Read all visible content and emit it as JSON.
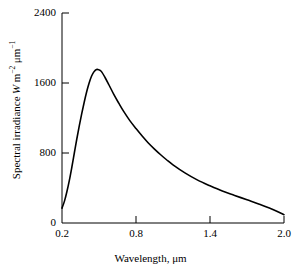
{
  "chart_data": {
    "type": "line",
    "title": "",
    "xlabel": "Wavelength, μm",
    "ylabel": "Spectral irradiance W m⁻² μm⁻¹",
    "ylabel_parts": {
      "text": "Spectral irradiance",
      "unit_symbol": "W",
      "unit_m": "m",
      "unit_m_exp": "−2",
      "unit_um": "μm",
      "unit_um_exp": "−1"
    },
    "xlim": [
      0.2,
      2.0
    ],
    "ylim": [
      0,
      2400
    ],
    "xticks": [
      0.2,
      0.8,
      1.4,
      2.0
    ],
    "xtick_labels": [
      "0.2",
      "0.8",
      "1.4",
      "2.0"
    ],
    "yticks": [
      0,
      800,
      1600,
      2400
    ],
    "ytick_labels": [
      "0",
      "800",
      "1600",
      "2400"
    ],
    "grid": false,
    "legend": false,
    "line_color": "#000000",
    "line_width": 1.6,
    "axis_color": "#000000",
    "background": "#ffffff",
    "series": [
      {
        "name": "Solar spectral irradiance",
        "x": [
          0.2,
          0.22,
          0.24,
          0.26,
          0.28,
          0.3,
          0.32,
          0.34,
          0.36,
          0.38,
          0.4,
          0.42,
          0.44,
          0.46,
          0.48,
          0.5,
          0.52,
          0.55,
          0.58,
          0.62,
          0.66,
          0.7,
          0.75,
          0.8,
          0.85,
          0.9,
          0.95,
          1.0,
          1.05,
          1.1,
          1.2,
          1.3,
          1.4,
          1.5,
          1.6,
          1.7,
          1.8,
          1.9,
          2.0
        ],
        "y": [
          170,
          250,
          360,
          490,
          640,
          800,
          960,
          1110,
          1250,
          1380,
          1500,
          1600,
          1680,
          1730,
          1755,
          1750,
          1730,
          1660,
          1580,
          1470,
          1370,
          1275,
          1170,
          1080,
          995,
          915,
          845,
          780,
          720,
          665,
          570,
          490,
          425,
          365,
          315,
          265,
          215,
          160,
          95
        ]
      }
    ]
  },
  "axis_geometry": {
    "left_px": 62,
    "right_px": 284,
    "top_px": 13,
    "bottom_px": 223,
    "tick_length_px": 5
  }
}
